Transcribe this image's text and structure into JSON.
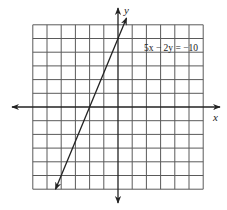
{
  "chart_data": {
    "type": "line",
    "title": "",
    "equation_label": "5x − 2y = −10",
    "xlabel": "x",
    "ylabel": "y",
    "grid": true,
    "xlim": [
      -6,
      6
    ],
    "ylim": [
      -6,
      6
    ],
    "grid_step": 1,
    "series": [
      {
        "name": "5x - 2y = -10",
        "slope": 2.5,
        "intercept": 5,
        "x_intercept": -2,
        "y_intercept": 5,
        "x": [
          -4.4,
          0.6
        ],
        "y": [
          -6,
          6.5
        ],
        "arrows": "both"
      }
    ],
    "legend": {
      "position": "upper-right",
      "entries": [
        "5x − 2y = −10"
      ]
    }
  },
  "labels": {
    "equation": "5x − 2y = −10",
    "x_axis": "x",
    "y_axis": "y"
  }
}
